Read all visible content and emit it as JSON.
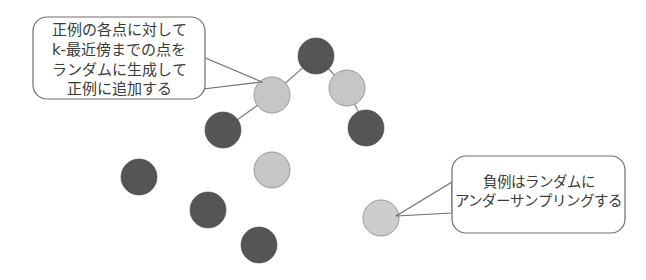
{
  "figure": {
    "background_color": "#ffffff",
    "width": 646,
    "height": 280,
    "stroke_color": "#6e6e6e",
    "text_color": "#3a3a3a"
  },
  "callouts": [
    {
      "name": "smote-positive-callout",
      "lines": [
        "正例の各点に対して",
        "k-最近傍までの点を",
        "ランダムに生成して",
        "正例に追加する"
      ],
      "box": {
        "x": 33,
        "y": 17,
        "width": 172,
        "height": 82,
        "radius": 14
      },
      "tail": {
        "from_x": 203,
        "from_y_top": 57,
        "from_y_bottom": 89,
        "to_x": 262,
        "to_y": 82
      },
      "points_to": "node-positive-upper-left"
    },
    {
      "name": "undersampling-negative-callout",
      "lines": [
        "負例はランダムに",
        "アンダーサンプリングする"
      ],
      "box": {
        "x": 452,
        "y": 156,
        "width": 173,
        "height": 77,
        "radius": 14
      },
      "tail": {
        "from_x": 452,
        "from_y_top": 182,
        "from_y_bottom": 213,
        "to_x": 396,
        "to_y": 216
      },
      "points_to": "node-negative-lower-right"
    }
  ],
  "chart_data": {
    "type": "scatter",
    "title": "",
    "xlabel": "",
    "ylabel": "",
    "grid": false,
    "legend": null,
    "classes": [
      {
        "key": "positive",
        "label": "正例",
        "fill": "#c6c6c6",
        "stroke": "#9a9a9a"
      },
      {
        "key": "negative",
        "label": "負例",
        "fill": "#555558",
        "stroke": "#45454a"
      }
    ],
    "radius": 18,
    "nodes": [
      {
        "id": "node-top-dark",
        "class": "negative",
        "x": 316,
        "y": 56,
        "fill": "#555558"
      },
      {
        "id": "node-positive-upper-left",
        "class": "positive",
        "x": 272,
        "y": 95,
        "fill": "#c6c6c6"
      },
      {
        "id": "node-lower-left-dark",
        "class": "negative",
        "x": 223,
        "y": 130,
        "fill": "#555558"
      },
      {
        "id": "node-positive-upper-right",
        "class": "positive",
        "x": 347,
        "y": 88,
        "fill": "#c6c6c6"
      },
      {
        "id": "node-lower-right-dark",
        "class": "negative",
        "x": 366,
        "y": 128,
        "fill": "#555558"
      },
      {
        "id": "node-left-dark",
        "class": "negative",
        "x": 139,
        "y": 177,
        "fill": "#555558"
      },
      {
        "id": "node-positive-middle",
        "class": "positive",
        "x": 272,
        "y": 170,
        "fill": "#c6c6c6"
      },
      {
        "id": "node-mid-dark",
        "class": "negative",
        "x": 208,
        "y": 210,
        "fill": "#555558"
      },
      {
        "id": "node-bottom-dark",
        "class": "negative",
        "x": 259,
        "y": 245,
        "fill": "#555558"
      },
      {
        "id": "node-negative-lower-right",
        "class": "positive",
        "x": 381,
        "y": 218,
        "fill": "#cdcdcd"
      }
    ],
    "edges": [
      {
        "from": "node-top-dark",
        "to": "node-positive-upper-left"
      },
      {
        "from": "node-positive-upper-left",
        "to": "node-lower-left-dark"
      },
      {
        "from": "node-top-dark",
        "to": "node-positive-upper-right"
      },
      {
        "from": "node-positive-upper-right",
        "to": "node-lower-right-dark"
      }
    ]
  }
}
